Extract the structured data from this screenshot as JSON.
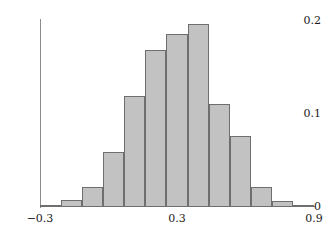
{
  "chart_data": {
    "type": "bar",
    "title": "",
    "subtitle": "",
    "xlabel": "",
    "ylabel": "",
    "grid": false,
    "legend": false,
    "xlim": [
      -0.3,
      0.9
    ],
    "ylim": [
      0,
      0.2
    ],
    "bin_width": 0.0923,
    "bin_edges": [
      -0.3,
      -0.2077,
      -0.1154,
      -0.0231,
      0.0692,
      0.1615,
      0.2538,
      0.3462,
      0.4385,
      0.5308,
      0.6231,
      0.7154,
      0.8077,
      0.9
    ],
    "categories": [
      "-0.300 to -0.208",
      "-0.208 to -0.115",
      "-0.115 to -0.023",
      "-0.023 to 0.069",
      "0.069 to 0.162",
      "0.162 to 0.254",
      "0.254 to 0.346",
      "0.346 to 0.438",
      "0.438 to 0.531",
      "0.531 to 0.623",
      "0.623 to 0.715",
      "0.715 to 0.808",
      "0.808 to 0.900"
    ],
    "values": [
      0.002,
      0.008,
      0.022,
      0.059,
      0.119,
      0.169,
      0.186,
      0.197,
      0.111,
      0.076,
      0.022,
      0.007,
      0.002
    ],
    "bars": [
      {
        "label": "bin-1",
        "value": 0.002,
        "x_left": -0.3,
        "x_right": -0.2077
      },
      {
        "label": "bin-2",
        "value": 0.008,
        "x_left": -0.2077,
        "x_right": -0.1154
      },
      {
        "label": "bin-3",
        "value": 0.022,
        "x_left": -0.1154,
        "x_right": -0.0231
      },
      {
        "label": "bin-4",
        "value": 0.059,
        "x_left": -0.0231,
        "x_right": 0.0692
      },
      {
        "label": "bin-5",
        "value": 0.119,
        "x_left": 0.0692,
        "x_right": 0.1615
      },
      {
        "label": "bin-6",
        "value": 0.169,
        "x_left": 0.1615,
        "x_right": 0.2538
      },
      {
        "label": "bin-7",
        "value": 0.186,
        "x_left": 0.2538,
        "x_right": 0.3462
      },
      {
        "label": "bin-8",
        "value": 0.197,
        "x_left": 0.3462,
        "x_right": 0.4385
      },
      {
        "label": "bin-9",
        "value": 0.111,
        "x_left": 0.4385,
        "x_right": 0.5308
      },
      {
        "label": "bin-10",
        "value": 0.076,
        "x_left": 0.5308,
        "x_right": 0.6231
      },
      {
        "label": "bin-11",
        "value": 0.022,
        "x_left": 0.6231,
        "x_right": 0.7154
      },
      {
        "label": "bin-12",
        "value": 0.007,
        "x_left": 0.7154,
        "x_right": 0.8077
      },
      {
        "label": "bin-13",
        "value": 0.002,
        "x_left": 0.8077,
        "x_right": 0.9
      }
    ],
    "y_ticks": [
      {
        "value": 0,
        "label": "0"
      },
      {
        "value": 0.1,
        "label": "0.1"
      },
      {
        "value": 0.2,
        "label": "0.2"
      }
    ],
    "x_ticks": [
      {
        "value": -0.3,
        "label": "−0.3"
      },
      {
        "value": 0.3,
        "label": "0.3"
      },
      {
        "value": 0.9,
        "label": "0.9"
      }
    ],
    "colors": {
      "bar_fill": "#c2c2c2",
      "bar_stroke": "#6e6e6e",
      "axis": "#8d8d8d",
      "text": "#1a1a1a",
      "background": "#ffffff"
    }
  }
}
